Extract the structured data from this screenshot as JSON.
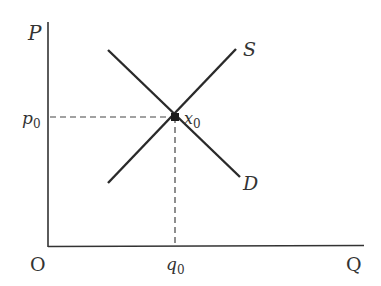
{
  "diagram": {
    "type": "supply-demand",
    "axes": {
      "y_label": "P",
      "x_label": "Q",
      "origin_label": "O"
    },
    "curves": [
      {
        "name": "supply",
        "label": "S"
      },
      {
        "name": "demand",
        "label": "D"
      }
    ],
    "equilibrium": {
      "label": "x",
      "label_sub": "0",
      "price_label": "p",
      "price_sub": "0",
      "quantity_label": "q",
      "quantity_sub": "0"
    }
  }
}
